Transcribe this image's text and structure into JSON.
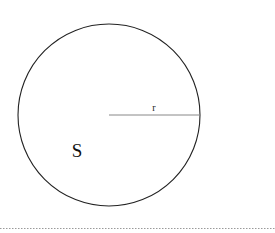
{
  "diagram": {
    "shape": "circle",
    "center": {
      "x": 109,
      "y": 115
    },
    "radius": 91,
    "stroke_color": "#222222",
    "radius_line": {
      "label": "r",
      "color": "#888888"
    },
    "area_label": "S",
    "separator": {
      "style": "dotted",
      "color": "#9a9a9a",
      "y": 228
    }
  }
}
